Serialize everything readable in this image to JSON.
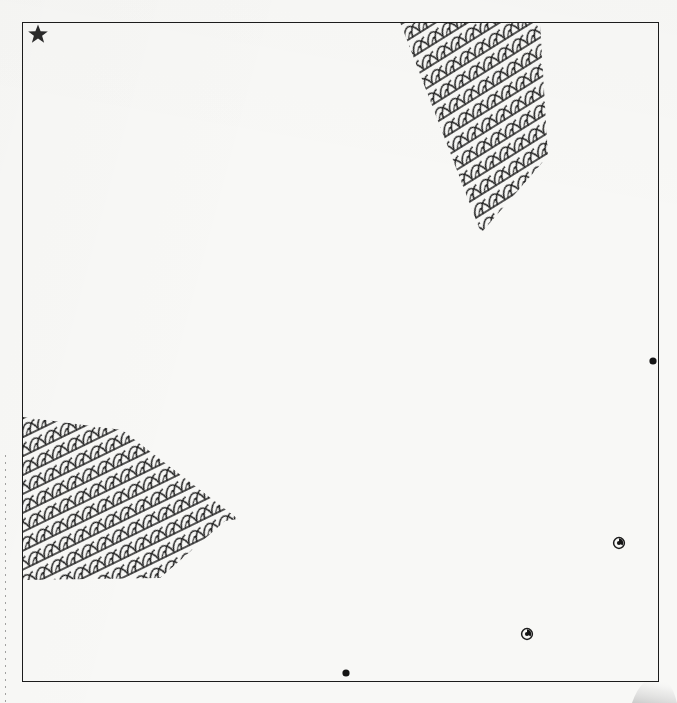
{
  "sheet": {
    "width": 677,
    "height": 703,
    "background_color": "#f8f8f6",
    "ink_color": "#1c1c1c",
    "description": "Scanned line-drawing site plan sheet"
  },
  "frame": {
    "name": "drawing-border",
    "left": 22,
    "top": 22,
    "width": 637,
    "height": 660,
    "stroke_color": "#1c1c1c",
    "stroke_width": 1.6
  },
  "hatch_regions": [
    {
      "id": "upper-right-vegetation",
      "label": "vegetation-hatch-upper-right",
      "pattern": "scale-mesh",
      "points": "400,22 540,22 548,156 481,233",
      "fill_color": "#1c1c1c"
    },
    {
      "id": "lower-left-vegetation",
      "label": "vegetation-hatch-lower-left",
      "pattern": "scale-mesh",
      "points": "23,417 122,430 238,519 225,521 160,578 23,580",
      "fill_color": "#1c1c1c"
    }
  ],
  "markers": [
    {
      "id": "star-top-left",
      "type": "star",
      "label": "north-point-star",
      "x": 38,
      "y": 34,
      "size": 17,
      "color": "#2a2a2a"
    },
    {
      "id": "dot-right-edge",
      "type": "dot",
      "label": "survey-point-right",
      "x": 653,
      "y": 361,
      "size": 7,
      "color": "#151515"
    },
    {
      "id": "node-right-lower",
      "type": "node",
      "label": "survey-node-right-lower",
      "x": 619,
      "y": 543,
      "size": 11,
      "color": "#151515"
    },
    {
      "id": "node-bottom-center",
      "type": "node",
      "label": "survey-node-bottom-center",
      "x": 527,
      "y": 634,
      "size": 11,
      "color": "#151515"
    },
    {
      "id": "dot-bottom-edge",
      "type": "dot",
      "label": "survey-point-bottom",
      "x": 346,
      "y": 673,
      "size": 7,
      "color": "#151515"
    }
  ],
  "artifacts": [
    {
      "id": "binding-dots",
      "label": "scan-binding-dotted-line",
      "x": 5,
      "y_start": 455,
      "y_end": 703
    },
    {
      "id": "page-curl",
      "label": "page-curl-shadow",
      "x": 628,
      "y": 676
    }
  ]
}
